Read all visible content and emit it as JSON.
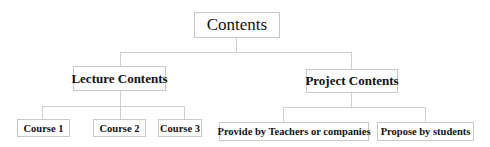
{
  "diagram": {
    "root": {
      "label": "Contents"
    },
    "branches": [
      {
        "label": "Lecture Contents",
        "children": [
          {
            "label": "Course 1"
          },
          {
            "label": "Course 2"
          },
          {
            "label": "Course 3"
          }
        ]
      },
      {
        "label": "Project Contents",
        "children": [
          {
            "label": "Provide by Teachers or companies"
          },
          {
            "label": "Propose by students"
          }
        ]
      }
    ]
  }
}
